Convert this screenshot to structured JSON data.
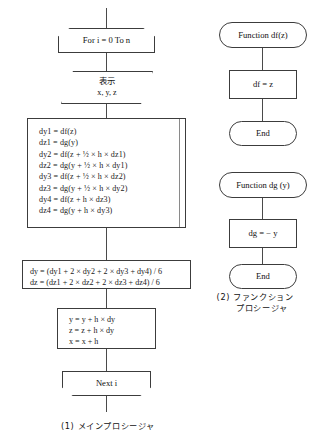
{
  "diagram": {
    "type": "flowchart",
    "title_main": "(1) メインプロシージャ",
    "title_func": "(2) ファンクション",
    "title_func_line2": "プロシージャ"
  },
  "main_procedure": {
    "loop_start": "For i = 0 To n",
    "display": {
      "line1": "表示",
      "line2": "x, y, z"
    },
    "compute_block": [
      "dy1 = df(z)",
      "dz1 = dg(y)",
      "dy2 = df(z + ½ × h × dz1)",
      "dz2 = dg(y + ½ × h × dy1)",
      "dy3 = df(z + ½ × h × dz2)",
      "dz3 = dg(y + ½ × h × dy2)",
      "dy4 = df(z + h × dz3)",
      "dz4 = dg(y + h × dy3)"
    ],
    "average_block": [
      "dy = (dy1 + 2 × dy2 + 2 × dy3 + dy4) / 6",
      "dz = (dz1 + 2 × dz2 + 2 × dz3 + dz4) / 6"
    ],
    "update_block": [
      "y = y + h × dy",
      "z = z + h × dy",
      "x = x + h"
    ],
    "loop_end": "Next i"
  },
  "function_df": {
    "header": "Function df(z)",
    "body": "df = z",
    "end": "End"
  },
  "function_dg": {
    "header": "Function dg (y)",
    "body": "dg = − y",
    "end": "End"
  },
  "colors": {
    "stroke": "#3c3c3c",
    "connector": "#4a4a4a",
    "inner_rule": "#8a8a8a",
    "background": "#ffffff",
    "text": "#111111"
  }
}
